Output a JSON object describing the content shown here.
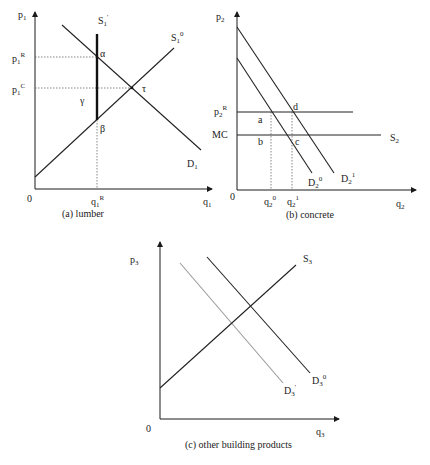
{
  "panel_a": {
    "caption": "(a) lumber",
    "y_axis": {
      "base": "p",
      "sub": "1"
    },
    "x_axis": {
      "base": "q",
      "sub": "1"
    },
    "origin": "0",
    "price_levels": [
      {
        "base": "p",
        "sub": "1",
        "sup": "R"
      },
      {
        "base": "p",
        "sub": "1",
        "sup": "C"
      }
    ],
    "quantity_marks": [
      {
        "base": "q",
        "sub": "1",
        "sup": "R"
      }
    ],
    "curves": [
      {
        "base": "S",
        "sub": "1",
        "sup": "'"
      },
      {
        "base": "S",
        "sub": "1",
        "sup": "0"
      },
      {
        "base": "D",
        "sub": "1",
        "sup": ""
      }
    ],
    "points": [
      "α",
      "γ",
      "β",
      "τ"
    ]
  },
  "panel_b": {
    "caption": "(b) concrete",
    "y_axis": {
      "base": "p",
      "sub": "2"
    },
    "x_axis": {
      "base": "q",
      "sub": "2"
    },
    "origin": "0",
    "price_levels": [
      {
        "base": "p",
        "sub": "2",
        "sup": "R"
      },
      {
        "base": "MC",
        "sub": "",
        "sup": ""
      }
    ],
    "quantity_marks": [
      {
        "base": "q",
        "sub": "2",
        "sup": "0"
      },
      {
        "base": "q",
        "sub": "2",
        "sup": "1"
      }
    ],
    "curves": [
      {
        "base": "S",
        "sub": "2",
        "sup": ""
      },
      {
        "base": "D",
        "sub": "2",
        "sup": "0"
      },
      {
        "base": "D",
        "sub": "2",
        "sup": "1"
      }
    ],
    "points": [
      "a",
      "b",
      "c",
      "d"
    ]
  },
  "panel_c": {
    "caption": "(c) other building products",
    "y_axis": {
      "base": "p",
      "sub": "3"
    },
    "x_axis": {
      "base": "q",
      "sub": "3"
    },
    "origin": "0",
    "curves": [
      {
        "base": "S",
        "sub": "3",
        "sup": ""
      },
      {
        "base": "D",
        "sub": "3",
        "sup": "0"
      },
      {
        "base": "D",
        "sub": "3",
        "sup": "'"
      }
    ]
  },
  "colors": {
    "line": "#222222",
    "shifted_demand": "#9a9a9a",
    "guide": "#555555"
  }
}
